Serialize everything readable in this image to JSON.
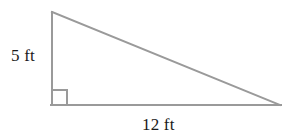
{
  "figure": {
    "type": "right-triangle-diagram",
    "background_color": "#ffffff",
    "stroke_color": "#9a9a9a",
    "stroke_width": 2,
    "text_color": "#1a1a1a",
    "labels": {
      "height": "5 ft",
      "base": "12 ft"
    },
    "right_angle_marker": {
      "present": true,
      "size": 15
    },
    "vertices": {
      "apex": {
        "x": 52,
        "y": 12
      },
      "right_angle": {
        "x": 52,
        "y": 105
      },
      "base_end": {
        "x": 280,
        "y": 105
      }
    },
    "measurements": {
      "height_value": 5,
      "height_unit": "ft",
      "base_value": 12,
      "base_unit": "ft"
    }
  }
}
